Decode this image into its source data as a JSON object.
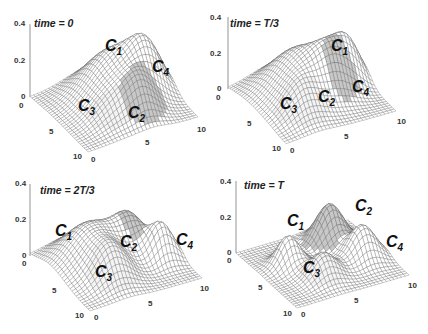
{
  "chart_data": [
    {
      "type": "surface",
      "title": "time = 0",
      "zlim": [
        0,
        0.4
      ],
      "zticks": [
        "0.4",
        "0.2",
        "0"
      ],
      "xticks": [
        "0",
        "5",
        "10"
      ],
      "yticks": [
        "0",
        "5",
        "10"
      ],
      "components": [
        {
          "name": "C1",
          "cx": 3.5,
          "cy": 5.5,
          "sigma": 2.2,
          "height": 0.25,
          "shade": "#ffffff"
        },
        {
          "name": "C2",
          "cx": 7.5,
          "cy": 6.0,
          "sigma": 1.2,
          "height": 0.15,
          "shade": "#c8c8c8"
        },
        {
          "name": "C3",
          "cx": 7.0,
          "cy": 3.5,
          "sigma": 1.4,
          "height": 0.08,
          "shade": "#f4f4f4"
        },
        {
          "name": "C4",
          "cx": 5.0,
          "cy": 8.0,
          "sigma": 1.3,
          "height": 0.22,
          "shade": "#ffffff"
        }
      ]
    },
    {
      "type": "surface",
      "title": "time = T/3",
      "zlim": [
        0,
        0.4
      ],
      "zticks": [
        "0.4",
        "0.2",
        "0"
      ],
      "xticks": [
        "0",
        "5",
        "10"
      ],
      "yticks": [
        "0",
        "5",
        "10"
      ],
      "components": [
        {
          "name": "C1",
          "cx": 3.5,
          "cy": 4.5,
          "sigma": 2.3,
          "height": 0.24,
          "shade": "#ffffff"
        },
        {
          "name": "C2",
          "cx": 5.5,
          "cy": 6.5,
          "sigma": 1.3,
          "height": 0.16,
          "shade": "#c8c8c8"
        },
        {
          "name": "C3",
          "cx": 7.0,
          "cy": 3.0,
          "sigma": 1.4,
          "height": 0.12,
          "shade": "#f4f4f4"
        },
        {
          "name": "C4",
          "cx": 4.5,
          "cy": 8.5,
          "sigma": 1.1,
          "height": 0.2,
          "shade": "#ffffff"
        }
      ]
    },
    {
      "type": "surface",
      "title": "time = 2T/3",
      "zlim": [
        0,
        0.4
      ],
      "zticks": [
        "0.4",
        "0.2",
        "0"
      ],
      "xticks": [
        "0",
        "5",
        "10"
      ],
      "yticks": [
        "0",
        "5",
        "10"
      ],
      "components": [
        {
          "name": "C1",
          "cx": 3.5,
          "cy": 3.5,
          "sigma": 2.1,
          "height": 0.22,
          "shade": "#ffffff"
        },
        {
          "name": "C2",
          "cx": 3.5,
          "cy": 7.0,
          "sigma": 1.2,
          "height": 0.17,
          "shade": "#c8c8c8"
        },
        {
          "name": "C3",
          "cx": 7.0,
          "cy": 3.5,
          "sigma": 1.3,
          "height": 0.15,
          "shade": "#f4f4f4"
        },
        {
          "name": "C4",
          "cx": 6.0,
          "cy": 8.5,
          "sigma": 1.0,
          "height": 0.2,
          "shade": "#ffffff"
        }
      ]
    },
    {
      "type": "surface",
      "title": "time = T",
      "zlim": [
        0,
        0.4
      ],
      "zticks": [
        "0.4",
        "0.2",
        "0"
      ],
      "xticks": [
        "0",
        "5",
        "10"
      ],
      "yticks": [
        "0",
        "5",
        "10"
      ],
      "components": [
        {
          "name": "C1",
          "cx": 4.0,
          "cy": 2.5,
          "sigma": 0.9,
          "height": 0.17,
          "shade": "#ffffff"
        },
        {
          "name": "C2",
          "cx": 2.5,
          "cy": 7.0,
          "sigma": 1.1,
          "height": 0.22,
          "shade": "#c8c8c8"
        },
        {
          "name": "C3",
          "cx": 7.0,
          "cy": 4.0,
          "sigma": 1.1,
          "height": 0.14,
          "shade": "#f4f4f4"
        },
        {
          "name": "C4",
          "cx": 6.0,
          "cy": 8.0,
          "sigma": 1.1,
          "height": 0.19,
          "shade": "#ffffff"
        }
      ]
    }
  ],
  "panels": [
    {
      "title": "time = 0",
      "labels": {
        "C1": {
          "x": 105,
          "y": 37
        },
        "C2": {
          "x": 128,
          "y": 104
        },
        "C3": {
          "x": 78,
          "y": 97
        },
        "C4": {
          "x": 152,
          "y": 58
        }
      }
    },
    {
      "title": "time = T/3",
      "labels": {
        "C1": {
          "x": 117,
          "y": 37
        },
        "C2": {
          "x": 104,
          "y": 88
        },
        "C3": {
          "x": 66,
          "y": 95
        },
        "C4": {
          "x": 138,
          "y": 78
        }
      }
    },
    {
      "title": "time = 2T/3",
      "labels": {
        "C1": {
          "x": 55,
          "y": 55
        },
        "C2": {
          "x": 120,
          "y": 66
        },
        "C3": {
          "x": 95,
          "y": 96
        },
        "C4": {
          "x": 176,
          "y": 64
        }
      }
    },
    {
      "title": "time = T",
      "labels": {
        "C1": {
          "x": 73,
          "y": 45
        },
        "C2": {
          "x": 141,
          "y": 30
        },
        "C3": {
          "x": 89,
          "y": 92
        },
        "C4": {
          "x": 172,
          "y": 66
        }
      }
    }
  ]
}
